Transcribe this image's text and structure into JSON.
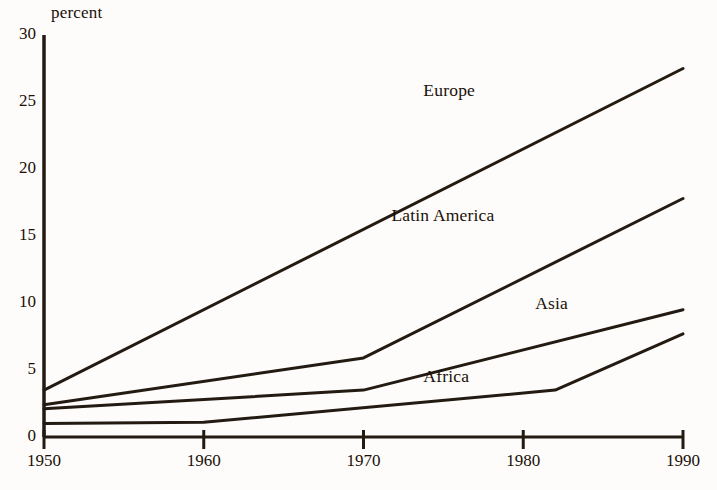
{
  "chart_data": {
    "type": "line",
    "title": "",
    "xlabel": "",
    "ylabel": "percent",
    "x": [
      1950,
      1960,
      1970,
      1980,
      1982,
      1990
    ],
    "xlim": [
      1950,
      1990
    ],
    "ylim": [
      0,
      30
    ],
    "xticks": [
      "1950",
      "1960",
      "1970",
      "1980",
      "1990"
    ],
    "yticks": [
      "0",
      "5",
      "10",
      "15",
      "20",
      "25",
      "30"
    ],
    "grid": false,
    "legend_position": "inline-right",
    "line_color": "#231a12",
    "series": [
      {
        "name": "Europe",
        "points": [
          {
            "x": 1950,
            "y": 3.5
          },
          {
            "x": 1990,
            "y": 27.5
          }
        ],
        "label_x": 1977,
        "label_y": 25.8
      },
      {
        "name": "Latin America",
        "points": [
          {
            "x": 1950,
            "y": 2.4
          },
          {
            "x": 1970,
            "y": 5.9
          },
          {
            "x": 1990,
            "y": 17.8
          }
        ],
        "label_x": 1975,
        "label_y": 16.5
      },
      {
        "name": "Asia",
        "points": [
          {
            "x": 1950,
            "y": 2.1
          },
          {
            "x": 1970,
            "y": 3.5
          },
          {
            "x": 1990,
            "y": 9.5
          }
        ],
        "label_x": 1984,
        "label_y": 9.9
      },
      {
        "name": "Africa",
        "points": [
          {
            "x": 1950,
            "y": 1.0
          },
          {
            "x": 1960,
            "y": 1.1
          },
          {
            "x": 1982,
            "y": 3.5
          },
          {
            "x": 1990,
            "y": 7.7
          }
        ],
        "label_x": 1977,
        "label_y": 4.5
      }
    ]
  }
}
